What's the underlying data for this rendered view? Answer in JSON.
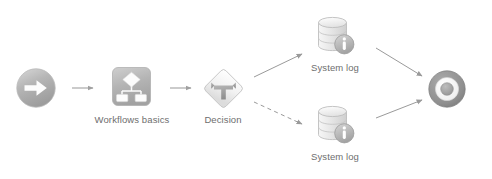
{
  "canvas": {
    "width": 492,
    "height": 179,
    "background": "#ffffff"
  },
  "diagram": {
    "type": "workflow-flowchart",
    "line_color": "#8a8a8a",
    "label_color": "#6e6e6e"
  },
  "nodes": [
    {
      "id": "start",
      "name": "start-node",
      "icon": "circle-arrow-right-icon",
      "label": "",
      "x": 16,
      "y": 68,
      "w": 40,
      "h": 40
    },
    {
      "id": "workflows-basics",
      "name": "workflows-basics-node",
      "icon": "workflow-diagram-icon",
      "label": "Workflows basics",
      "x": 112,
      "y": 67,
      "w": 39,
      "h": 39
    },
    {
      "id": "decision",
      "name": "decision-node",
      "icon": "decision-fork-icon",
      "label": "Decision",
      "x": 203,
      "y": 68,
      "w": 41,
      "h": 41
    },
    {
      "id": "system-log-top",
      "name": "system-log-node-top",
      "icon": "database-info-icon",
      "label": "System log",
      "x": 314,
      "y": 14,
      "w": 42,
      "h": 42
    },
    {
      "id": "system-log-bottom",
      "name": "system-log-node-bottom",
      "icon": "database-info-icon",
      "label": "System log",
      "x": 314,
      "y": 103,
      "w": 42,
      "h": 42
    },
    {
      "id": "end",
      "name": "end-node",
      "icon": "bullseye-target-icon",
      "label": "",
      "x": 428,
      "y": 70,
      "w": 38,
      "h": 38
    }
  ],
  "connectors": [
    {
      "id": "c1",
      "name": "connector-start-to-workflows",
      "style": "solid",
      "from": "start",
      "to": "workflows-basics"
    },
    {
      "id": "c2",
      "name": "connector-workflows-to-decision",
      "style": "solid",
      "from": "workflows-basics",
      "to": "decision"
    },
    {
      "id": "c3",
      "name": "connector-decision-to-system-log-top",
      "style": "solid",
      "from": "decision",
      "to": "system-log-top"
    },
    {
      "id": "c4",
      "name": "connector-decision-to-system-log-bottom",
      "style": "dashed",
      "from": "decision",
      "to": "system-log-bottom"
    },
    {
      "id": "c5",
      "name": "connector-system-log-top-to-end",
      "style": "solid",
      "from": "system-log-top",
      "to": "end"
    },
    {
      "id": "c6",
      "name": "connector-system-log-bottom-to-end",
      "style": "solid",
      "from": "system-log-bottom",
      "to": "end"
    }
  ],
  "labels": {
    "workflows_basics": "Workflows basics",
    "decision": "Decision",
    "system_log_top": "System log",
    "system_log_bottom": "System log"
  }
}
